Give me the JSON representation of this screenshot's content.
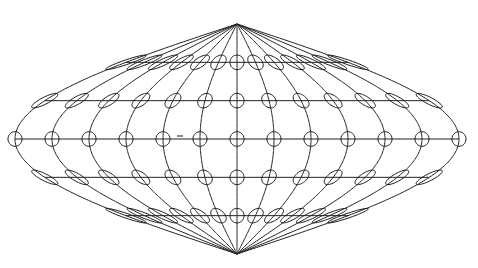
{
  "figure": {
    "projection": "sinusoidal",
    "canvas": {
      "width": 478,
      "height": 268,
      "background": "#ffffff"
    },
    "center": {
      "x": 237,
      "y": 139
    },
    "px_per_degree_x": 1.2333,
    "px_per_degree_y": 1.2778,
    "line_color": "#1a1a1a",
    "graticule": {
      "meridians_deg": [
        -180,
        -150,
        -120,
        -90,
        -60,
        -30,
        0,
        30,
        60,
        90,
        120,
        150,
        180
      ],
      "parallels_deg": [
        -60,
        -30,
        0,
        30,
        60
      ]
    },
    "tissot": {
      "radius_deg": 5.7,
      "latitudes_deg": [
        -60,
        -30,
        0,
        30,
        60
      ],
      "longitudes_deg": [
        -180,
        -150,
        -120,
        -90,
        -60,
        -30,
        0,
        30,
        60,
        90,
        120,
        150,
        180
      ]
    },
    "artifacts": [
      {
        "type": "dash",
        "x1": 177,
        "y1": 136,
        "x2": 183,
        "y2": 136
      }
    ]
  }
}
